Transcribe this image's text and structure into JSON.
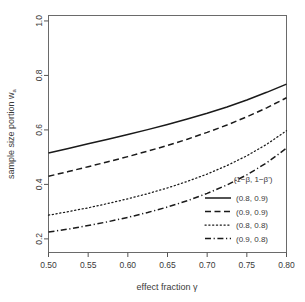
{
  "chart_data": {
    "type": "line",
    "title": "",
    "xlabel": "effect fraction γ",
    "ylabel": "sample size portion w",
    "ylabel_subscript": "a",
    "xlim": [
      0.5,
      0.8
    ],
    "ylim": [
      0.15,
      1.02
    ],
    "grid": false,
    "xticks": [
      0.5,
      0.55,
      0.6,
      0.65,
      0.7,
      0.75,
      0.8
    ],
    "xtick_labels": [
      "0.50",
      "0.55",
      "0.60",
      "0.65",
      "0.70",
      "0.75",
      "0.80"
    ],
    "yticks": [
      0.2,
      0.4,
      0.6,
      0.8,
      1.0
    ],
    "ytick_labels": [
      "0.2",
      "0.4",
      "0.6",
      "0.8",
      "1.0"
    ],
    "legend_position": "bottom-right-inside",
    "legend_title": "(1−β, 1−β')",
    "x": [
      0.5,
      0.525,
      0.55,
      0.575,
      0.6,
      0.625,
      0.65,
      0.675,
      0.7,
      0.725,
      0.75,
      0.775,
      0.8
    ],
    "series": [
      {
        "name": "(0.8, 0.9)",
        "dash": "solid",
        "values": [
          0.515,
          0.532,
          0.549,
          0.566,
          0.583,
          0.601,
          0.62,
          0.64,
          0.661,
          0.684,
          0.71,
          0.738,
          0.768
        ]
      },
      {
        "name": "(0.9, 0.9)",
        "dash": "dashed",
        "values": [
          0.43,
          0.447,
          0.465,
          0.483,
          0.502,
          0.522,
          0.543,
          0.566,
          0.591,
          0.618,
          0.648,
          0.681,
          0.718
        ]
      },
      {
        "name": "(0.8, 0.8)",
        "dash": "dotted",
        "values": [
          0.287,
          0.3,
          0.314,
          0.33,
          0.347,
          0.366,
          0.387,
          0.411,
          0.438,
          0.469,
          0.505,
          0.547,
          0.597
        ]
      },
      {
        "name": "(0.9, 0.8)",
        "dash": "dashdot",
        "values": [
          0.225,
          0.236,
          0.249,
          0.263,
          0.279,
          0.297,
          0.317,
          0.34,
          0.367,
          0.398,
          0.435,
          0.479,
          0.533
        ]
      }
    ]
  },
  "legend": {
    "title": "(1−β, 1−β')",
    "items": [
      {
        "label": "(0.8, 0.9)",
        "dash": "solid"
      },
      {
        "label": "(0.9, 0.9)",
        "dash": "dashed"
      },
      {
        "label": "(0.8, 0.8)",
        "dash": "dotted"
      },
      {
        "label": "(0.9, 0.8)",
        "dash": "dashdot"
      }
    ]
  },
  "axes": {
    "x_title": "effect fraction γ",
    "y_title_main": "sample size portion w",
    "y_title_sub": "a"
  },
  "colors": {
    "line": "#1a1a1a",
    "axis": "#555555",
    "background": "#ffffff",
    "text": "#3a3a3a"
  }
}
